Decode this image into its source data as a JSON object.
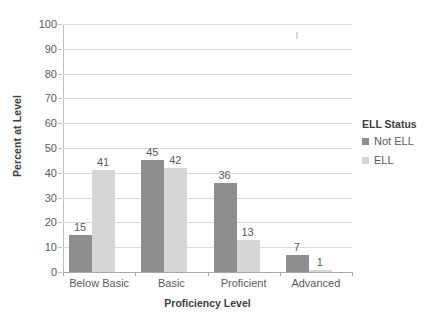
{
  "chart_data": {
    "type": "bar",
    "title": "",
    "xlabel": "Proficiency Level",
    "ylabel": "Percent at Level",
    "categories": [
      "Below Basic",
      "Basic",
      "Proficient",
      "Advanced"
    ],
    "series": [
      {
        "name": "Not ELL",
        "values": [
          15,
          45,
          36,
          7
        ],
        "color": "#8e8e8e"
      },
      {
        "name": "ELL",
        "values": [
          41,
          42,
          13,
          1
        ],
        "color": "#d6d6d6"
      }
    ],
    "ylim": [
      0,
      100
    ],
    "ytick_step": 10,
    "yticks": [
      0,
      10,
      20,
      30,
      40,
      50,
      60,
      70,
      80,
      90,
      100
    ],
    "ytick_labels": [
      "0",
      "10",
      "20",
      "30",
      "40",
      "50",
      "60",
      "70",
      "80",
      "90",
      "100"
    ],
    "grid": true,
    "grid_axis": "y",
    "data_labels": true,
    "legend": {
      "title": "ELL Status",
      "position": "right",
      "entries": [
        "Not ELL",
        "ELL"
      ]
    },
    "colors": {
      "gridline": "#d9d9d9",
      "axis": "#a6a6a6",
      "text": "#5a5a5a",
      "title_text": "#404040",
      "background": "#ffffff"
    }
  }
}
